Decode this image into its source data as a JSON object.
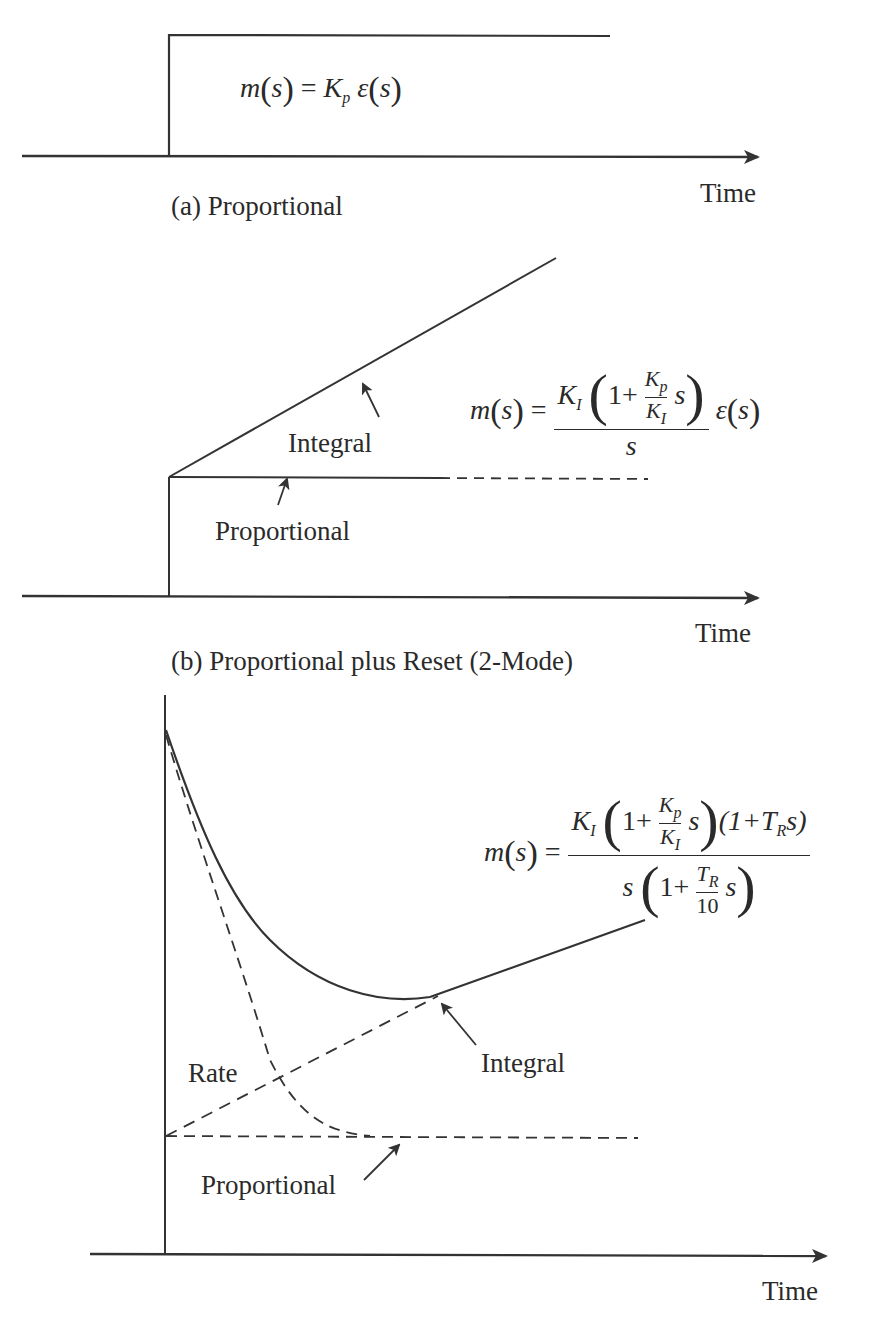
{
  "top_cut_text": "(partial line cut off at top edge)",
  "panels": [
    {
      "id": "a",
      "caption": "(a)  Proportional",
      "axis_label": "Time",
      "equation": {
        "lhs": "m(s)",
        "rhs": "K_p ε(s)",
        "lhs_m": "m",
        "arg": "s",
        "gain": "K",
        "gain_sub": "p",
        "eps": "ε"
      },
      "signal": "step"
    },
    {
      "id": "b",
      "caption": "(b) Proportional plus Reset (2-Mode)",
      "axis_label": "Time",
      "annotations": [
        "Integral",
        "Proportional"
      ],
      "equation": {
        "lhs_m": "m",
        "arg": "s",
        "num_gain": "K",
        "num_gain_sub": "I",
        "one_plus": "1+",
        "inner_num": "K",
        "inner_num_sub": "p",
        "inner_den": "K",
        "inner_den_sub": "I",
        "inner_s": "s",
        "den": "s",
        "eps": "ε"
      },
      "signal": "step plus ramp"
    },
    {
      "id": "c",
      "caption": "",
      "axis_label": "Time",
      "annotations": [
        "Rate",
        "Integral",
        "Proportional"
      ],
      "equation": {
        "lhs_m": "m",
        "arg": "s",
        "num_gain": "K",
        "num_gain_sub": "I",
        "one_plus": "1+",
        "inner_num": "K",
        "inner_num_sub": "p",
        "inner_den": "K",
        "inner_den_sub": "I",
        "inner_s": "s",
        "rate_term": "(1+T",
        "rate_sub": "R",
        "rate_tail": "s)",
        "den_s": "s",
        "den_one_plus": "1+",
        "den_inner_num": "T",
        "den_inner_num_sub": "R",
        "den_inner_den": "10",
        "den_inner_s": "s"
      },
      "signal": "step plus ramp plus decaying rate"
    }
  ],
  "colors": {
    "line": "#2a2a2a",
    "background": "#ffffff"
  }
}
